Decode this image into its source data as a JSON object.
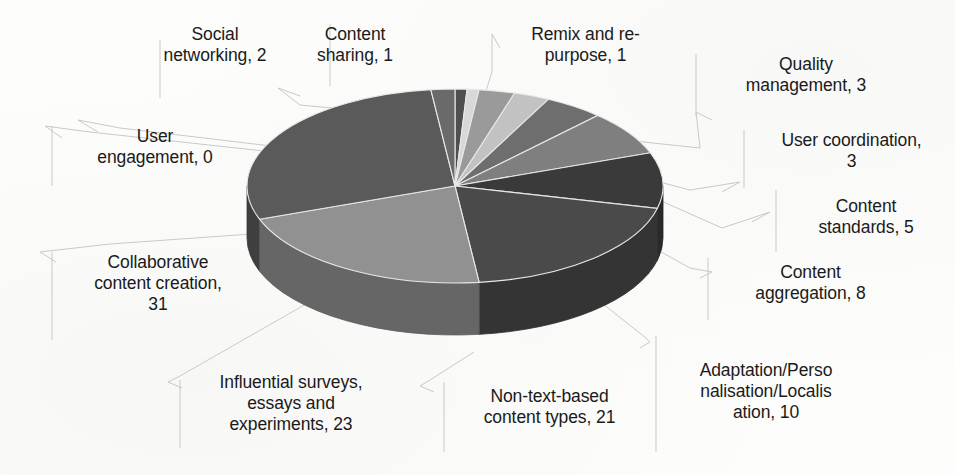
{
  "chart_data": {
    "type": "pie",
    "title": "",
    "three_d": true,
    "palette": "grayscale",
    "total": 108,
    "legend": "none (data labels with leader lines)",
    "label_format": "{category}, {value}",
    "categories": [
      "Content sharing",
      "Remix and re-purpose",
      "Quality management",
      "User coordination",
      "Content standards",
      "Content aggregation",
      "Adaptation/Personalisation/Localisation",
      "Non-text-based content types",
      "Influential surveys, essays and experiments",
      "Collaborative content creation",
      "User engagement",
      "Social networking"
    ],
    "values": [
      1,
      1,
      3,
      3,
      5,
      8,
      10,
      21,
      23,
      31,
      0,
      2
    ],
    "slice_colors": [
      "#4f4f4f",
      "#d8d8d8",
      "#9a9a9a",
      "#c2c2c2",
      "#6e6e6e",
      "#7f7f7f",
      "#3a3a3a",
      "#4a4a4a",
      "#919191",
      "#5a5a5a",
      "#8a8a8a",
      "#6a6a6a"
    ]
  },
  "labels": [
    {
      "id": "content-sharing",
      "text": "Content\nsharing, 1",
      "value": 1
    },
    {
      "id": "remix-and-repurpose",
      "text": "Remix and re-\npurpose, 1",
      "value": 1
    },
    {
      "id": "quality-management",
      "text": "Quality\nmanagement, 3",
      "value": 3
    },
    {
      "id": "user-coordination",
      "text": "User coordination,\n3",
      "value": 3
    },
    {
      "id": "content-standards",
      "text": "Content\nstandards, 5",
      "value": 5
    },
    {
      "id": "content-aggregation",
      "text": "Content\naggregation, 8",
      "value": 8
    },
    {
      "id": "adaptation-localisation",
      "text": "Adaptation/Perso\nnalisation/Localis\nation, 10",
      "value": 10
    },
    {
      "id": "non-text-based",
      "text": "Non-text-based\ncontent types, 21",
      "value": 21
    },
    {
      "id": "influential-surveys",
      "text": "Influential surveys,\nessays and\nexperiments, 23",
      "value": 23
    },
    {
      "id": "collaborative-creation",
      "text": "Collaborative\ncontent creation,\n31",
      "value": 31
    },
    {
      "id": "user-engagement",
      "text": "User\nengagement, 0",
      "value": 0
    },
    {
      "id": "social-networking",
      "text": "Social\nnetworking, 2",
      "value": 2
    }
  ]
}
